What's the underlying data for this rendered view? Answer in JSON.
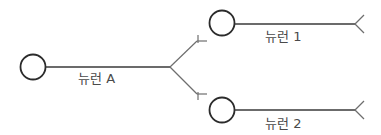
{
  "diagram": {
    "title": "",
    "neurons": [
      {
        "id": "A",
        "label": "뉴런 A"
      },
      {
        "id": "1",
        "label": "뉴런 1"
      },
      {
        "id": "2",
        "label": "뉴런 2"
      }
    ],
    "connections": [
      {
        "from": "A",
        "to": "1",
        "type": "synapse"
      },
      {
        "from": "A",
        "to": "2",
        "type": "synapse"
      }
    ],
    "colors": {
      "stroke": "#2b2b2b",
      "axon": "#3a3a3a",
      "terminal": "#6e6e6e",
      "text": "#4a4a4a"
    }
  }
}
